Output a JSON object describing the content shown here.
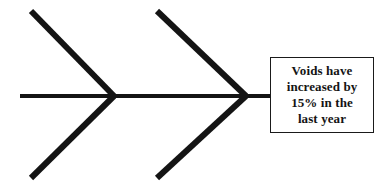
{
  "diagram": {
    "type": "fishbone-ishikawa",
    "title": "",
    "background_color": "#ffffff",
    "line_color": "#141414",
    "spine": {
      "name": "spine",
      "x1": 20,
      "y1": 96,
      "x2": 271,
      "y2": 96,
      "thickness": 4
    },
    "bones": [
      {
        "name": "upper-left-bone",
        "position": "upper-left",
        "x1": 31,
        "y1": 11,
        "x2": 114,
        "y2": 96,
        "thickness": 6
      },
      {
        "name": "lower-left-bone",
        "position": "lower-left",
        "x1": 31,
        "y1": 178,
        "x2": 114,
        "y2": 96,
        "thickness": 6
      },
      {
        "name": "upper-right-bone",
        "position": "upper-right",
        "x1": 157,
        "y1": 11,
        "x2": 246,
        "y2": 96,
        "thickness": 6
      },
      {
        "name": "lower-right-bone",
        "position": "lower-right",
        "x1": 157,
        "y1": 178,
        "x2": 246,
        "y2": 96,
        "thickness": 6
      }
    ],
    "junctions": [
      {
        "name": "left-junction",
        "x": 114,
        "y": 96
      },
      {
        "name": "right-junction",
        "x": 246,
        "y": 96
      }
    ]
  },
  "callout": {
    "border_color": "#1a1a1a",
    "background_color": "#ffffff",
    "text_color": "#141414",
    "full_text": "Voids have increased by 15% in the last year",
    "lines": [
      "Voids have",
      "increased by",
      "15% in the",
      "last year"
    ]
  }
}
